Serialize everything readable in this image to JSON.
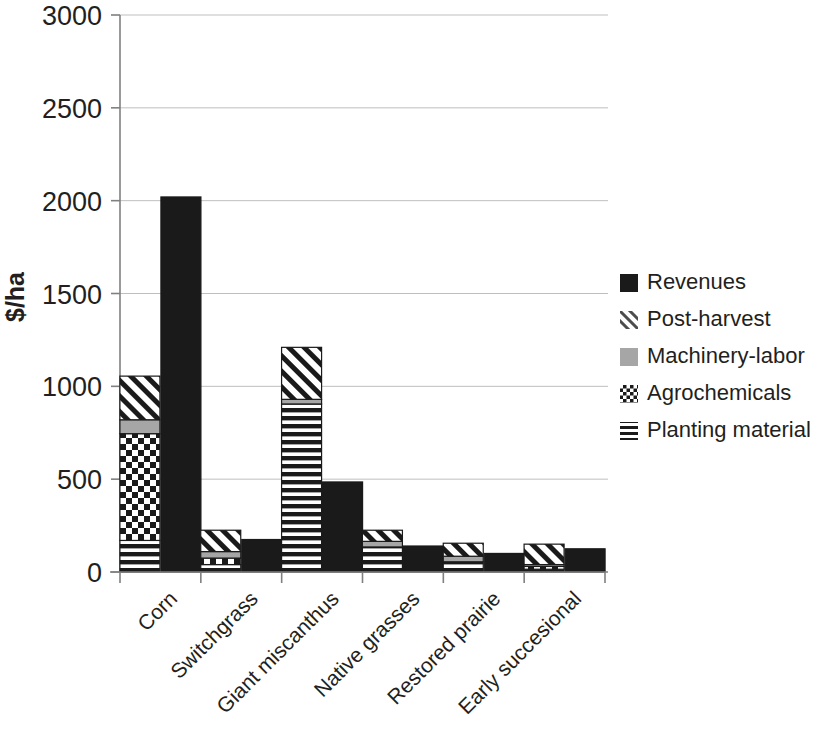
{
  "chart_data": {
    "type": "bar",
    "subtype": "stacked-cost-vs-revenue",
    "title": "",
    "xlabel": "",
    "ylabel": "$/ha",
    "ylim": [
      0,
      3000
    ],
    "ytick_values": [
      0,
      500,
      1000,
      1500,
      2000,
      2500,
      3000
    ],
    "ytick_labels": [
      "0",
      "500",
      "1000",
      "1500",
      "2000",
      "2500",
      "3000"
    ],
    "grid": true,
    "legend_position": "right",
    "categories": [
      "Corn",
      "Switchgrass",
      "Giant miscanthus",
      "Native grasses",
      "Restored prairie",
      "Early succesional"
    ],
    "series": [
      {
        "name": "Revenues",
        "pattern": "solid-black",
        "values": [
          2020,
          175,
          485,
          140,
          100,
          125
        ]
      },
      {
        "name": "Post-harvest",
        "pattern": "diagonal-hatch",
        "values": [
          235,
          115,
          280,
          60,
          70,
          110
        ]
      },
      {
        "name": "Machinery-labor",
        "pattern": "solid-gray",
        "values": [
          75,
          35,
          25,
          30,
          30,
          10
        ]
      },
      {
        "name": "Agrochemicals",
        "pattern": "checker",
        "values": [
          575,
          35,
          0,
          0,
          0,
          15
        ]
      },
      {
        "name": "Planting material",
        "pattern": "horizontal-lines",
        "values": [
          170,
          40,
          905,
          135,
          55,
          15
        ]
      }
    ],
    "stack_totals": [
      1055,
      225,
      1210,
      225,
      155,
      150
    ],
    "stack_order_bottom_to_top": [
      "Planting material",
      "Agrochemicals",
      "Machinery-labor",
      "Post-harvest"
    ]
  },
  "legend": {
    "items": [
      {
        "label": "Revenues",
        "swatch": "legend-swatch-solid-black"
      },
      {
        "label": "Post-harvest",
        "swatch": "legend-swatch-diagonal-hatch"
      },
      {
        "label": "Machinery-labor",
        "swatch": "legend-swatch-solid-gray"
      },
      {
        "label": "Agrochemicals",
        "swatch": "legend-swatch-checker"
      },
      {
        "label": "Planting material",
        "swatch": "legend-swatch-horizontal-lines"
      }
    ]
  },
  "colors": {
    "black": "#1a1a1a",
    "gray": "#a6a6a6",
    "gridline": "#bfbfbf",
    "axis": "#808080",
    "background": "#ffffff",
    "text": "#231f20"
  }
}
